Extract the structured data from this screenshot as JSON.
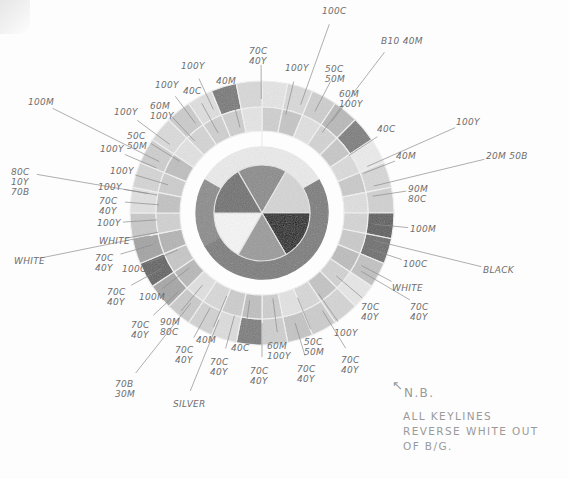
{
  "diagram": {
    "type": "hand-drawn color wheel specification",
    "center": {
      "x": 262,
      "y": 213
    },
    "inner_pie": {
      "radius": 48,
      "slices": [
        {
          "label": "100C",
          "shade": "#8a8a8a"
        },
        {
          "label": "20M 50B",
          "shade": "#d6d6d6"
        },
        {
          "label": "BLACK",
          "shade": "#141414"
        },
        {
          "label": "SILVER",
          "shade": "#9a9a9a"
        },
        {
          "label": "WHITE",
          "shade": "#f7f7f7"
        },
        {
          "label": "80C 10Y 70B",
          "shade": "#6e6e6e"
        }
      ]
    },
    "rings": {
      "white_band": "#f2f2f2",
      "dark_band": "#7a7a7a",
      "outer_ring_1": "#cfcfcf",
      "outer_ring_2": "#bdbdbd"
    }
  },
  "labels": [
    {
      "id": "100c-top",
      "text": "100C",
      "x": 322,
      "y": 6
    },
    {
      "id": "b10-40m",
      "text": "B10 40M",
      "x": 381,
      "y": 36
    },
    {
      "id": "70c-40y-top",
      "text": "70C\n40Y",
      "x": 249,
      "y": 46
    },
    {
      "id": "100y-top",
      "text": "100Y",
      "x": 285,
      "y": 63
    },
    {
      "id": "50c-50m-top",
      "text": "50C\n50M",
      "x": 325,
      "y": 64
    },
    {
      "id": "100y-left-top",
      "text": "100Y",
      "x": 181,
      "y": 61
    },
    {
      "id": "40m-top",
      "text": "40M",
      "x": 216,
      "y": 76
    },
    {
      "id": "100y-a",
      "text": "100Y",
      "x": 155,
      "y": 80
    },
    {
      "id": "40c-top",
      "text": "40C",
      "x": 183,
      "y": 86
    },
    {
      "id": "60m-100y-a",
      "text": "60M\n100Y",
      "x": 339,
      "y": 89
    },
    {
      "id": "60m-100y-b",
      "text": "60M\n100Y",
      "x": 150,
      "y": 101
    },
    {
      "id": "100m-left",
      "text": "100M",
      "x": 28,
      "y": 97
    },
    {
      "id": "100y-b",
      "text": "100Y",
      "x": 114,
      "y": 107
    },
    {
      "id": "40c-right",
      "text": "40C",
      "x": 377,
      "y": 124
    },
    {
      "id": "100y-right",
      "text": "100Y",
      "x": 456,
      "y": 117
    },
    {
      "id": "50c-50m-left",
      "text": "50C\n50M",
      "x": 127,
      "y": 131
    },
    {
      "id": "100y-c",
      "text": "100Y",
      "x": 100,
      "y": 144
    },
    {
      "id": "40m-right",
      "text": "40M",
      "x": 396,
      "y": 151
    },
    {
      "id": "20m-50b",
      "text": "20M 50B",
      "x": 486,
      "y": 151
    },
    {
      "id": "80c-10y-70b",
      "text": "80C\n10Y\n70B",
      "x": 11,
      "y": 167
    },
    {
      "id": "100y-d",
      "text": "100Y",
      "x": 110,
      "y": 166
    },
    {
      "id": "100y-e",
      "text": "100Y",
      "x": 98,
      "y": 182
    },
    {
      "id": "90m-80c",
      "text": "90M\n80C",
      "x": 408,
      "y": 184
    },
    {
      "id": "70c-40y-a",
      "text": "70C\n40Y",
      "x": 99,
      "y": 196
    },
    {
      "id": "100m-right",
      "text": "100M",
      "x": 410,
      "y": 224
    },
    {
      "id": "100y-f",
      "text": "100Y",
      "x": 97,
      "y": 218
    },
    {
      "id": "white-a",
      "text": "WHITE",
      "x": 99,
      "y": 236
    },
    {
      "id": "100c-right",
      "text": "100C",
      "x": 403,
      "y": 259
    },
    {
      "id": "white-left",
      "text": "WHITE",
      "x": 14,
      "y": 256
    },
    {
      "id": "black",
      "text": "BLACK",
      "x": 483,
      "y": 265
    },
    {
      "id": "70c-40y-b",
      "text": "70C\n40Y",
      "x": 95,
      "y": 253
    },
    {
      "id": "100c-left",
      "text": "100C",
      "x": 122,
      "y": 264
    },
    {
      "id": "white-right",
      "text": "WHITE",
      "x": 392,
      "y": 283
    },
    {
      "id": "70c-40y-c",
      "text": "70C\n40Y",
      "x": 107,
      "y": 287
    },
    {
      "id": "100m-bottom",
      "text": "100M",
      "x": 139,
      "y": 292
    },
    {
      "id": "70c-40y-right-a",
      "text": "70C\n40Y",
      "x": 361,
      "y": 302
    },
    {
      "id": "70c-40y-right-b",
      "text": "70C\n40Y",
      "x": 410,
      "y": 302
    },
    {
      "id": "70c-40y-d",
      "text": "70C\n40Y",
      "x": 131,
      "y": 320
    },
    {
      "id": "90m-80c-bottom",
      "text": "90M\n80C",
      "x": 160,
      "y": 317
    },
    {
      "id": "40m-bottom",
      "text": "40M",
      "x": 196,
      "y": 335
    },
    {
      "id": "40c-bottom",
      "text": "40C",
      "x": 231,
      "y": 343
    },
    {
      "id": "100y-bottom",
      "text": "100Y",
      "x": 334,
      "y": 328
    },
    {
      "id": "50c-50m-bottom",
      "text": "50C\n50M",
      "x": 304,
      "y": 337
    },
    {
      "id": "60m-100y-bottom",
      "text": "60M\n100Y",
      "x": 267,
      "y": 341
    },
    {
      "id": "70c-40y-e",
      "text": "70C\n40Y",
      "x": 175,
      "y": 345
    },
    {
      "id": "70c-40y-f",
      "text": "70C\n40Y",
      "x": 210,
      "y": 357
    },
    {
      "id": "70c-40y-g",
      "text": "70C\n40Y",
      "x": 250,
      "y": 366
    },
    {
      "id": "70c-40y-h",
      "text": "70C\n40Y",
      "x": 297,
      "y": 364
    },
    {
      "id": "70c-40y-i",
      "text": "70C\n40Y",
      "x": 341,
      "y": 355
    },
    {
      "id": "70b-30m",
      "text": "70B\n30M",
      "x": 115,
      "y": 379
    },
    {
      "id": "silver",
      "text": "SILVER",
      "x": 173,
      "y": 399
    }
  ],
  "note": {
    "arrow": "↖",
    "title": "N.B.",
    "lines": [
      "ALL KEYLINES",
      "REVERSE WHITE OUT",
      "OF B/G."
    ]
  }
}
